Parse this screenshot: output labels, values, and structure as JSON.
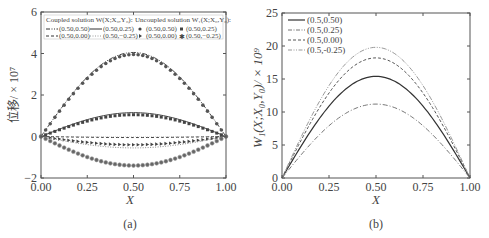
{
  "chart_data": [
    {
      "panel": "a",
      "type": "line",
      "caption": "(a)",
      "xlabel": "X",
      "ylabel": "位移/ × 10⁷",
      "xlim": [
        0,
        1
      ],
      "ylim": [
        -2,
        6
      ],
      "xticks": [
        "0.00",
        "0.25",
        "0.50",
        "0.75",
        "1.00"
      ],
      "yticks": [
        "−2",
        "0",
        "2",
        "4",
        "6"
      ],
      "grid": false,
      "legend": {
        "position": "upper",
        "coupled_title": "Coupled solution W(X;X₀,Y₀):",
        "uncoupled_title": "Uncoupled solution W₁(X;X₀,Y₀):",
        "coupled": [
          {
            "label": "(0.50,0.50)",
            "style": "dash-dot-dot"
          },
          {
            "label": "(0.50,0.25)",
            "style": "solid"
          },
          {
            "label": "(0.50,0.00)",
            "style": "dashed"
          },
          {
            "label": "(0.50,−0.25)",
            "style": "dotted"
          }
        ],
        "uncoupled": [
          {
            "label": "(0.50,0.50)",
            "marker": "circle"
          },
          {
            "label": "(0.50,0.25)",
            "marker": "square"
          },
          {
            "label": "(0.50,0.00)",
            "marker": "triangle-right"
          },
          {
            "label": "(0.50,−0.25)",
            "marker": "star"
          }
        ]
      },
      "series": [
        {
          "name": "(0.50,0.50) coupled",
          "style": "dash-dot-dot",
          "peak_x": 0.5,
          "peak_y": 4.05
        },
        {
          "name": "(0.50,0.50) uncoupled",
          "marker": "circle",
          "peak_x": 0.5,
          "peak_y": 3.95
        },
        {
          "name": "(0.50,0.25) coupled",
          "style": "solid",
          "peak_x": 0.5,
          "peak_y": 1.15
        },
        {
          "name": "(0.50,0.25) uncoupled",
          "marker": "square",
          "peak_x": 0.5,
          "peak_y": 1.05
        },
        {
          "name": "(0.50,0.00) coupled",
          "style": "dashed",
          "peak_x": 0.5,
          "peak_y": -0.05
        },
        {
          "name": "(0.50,0.00) uncoupled",
          "marker": "triangle-right",
          "peak_x": 0.5,
          "peak_y": -0.4
        },
        {
          "name": "(0.50,−0.25) coupled",
          "style": "dotted",
          "peak_x": 0.5,
          "peak_y": -0.55
        },
        {
          "name": "(0.50,−0.25) uncoupled",
          "marker": "star",
          "peak_x": 0.5,
          "peak_y": -1.4
        }
      ]
    },
    {
      "panel": "b",
      "type": "line",
      "caption": "(b)",
      "xlabel": "X",
      "ylabel": "W₁(X;X₀,Y₀)/ × 10⁹",
      "xlim": [
        0,
        1
      ],
      "ylim": [
        0,
        25
      ],
      "xticks": [
        "0.00",
        "0.25",
        "0.50",
        "0.75",
        "1.00"
      ],
      "yticks": [
        "0",
        "5",
        "10",
        "15",
        "20",
        "25"
      ],
      "grid": false,
      "legend": {
        "position": "upper left",
        "entries": [
          {
            "label": "(0.5,0.50)",
            "style": "solid"
          },
          {
            "label": "(0.5,0.25)",
            "style": "dash-dot"
          },
          {
            "label": "(0.5,0.00)",
            "style": "dashed"
          },
          {
            "label": "(0.5,-0.25)",
            "style": "dash-dot-dot"
          }
        ]
      },
      "series": [
        {
          "name": "(0.5,0.50)",
          "style": "solid",
          "peak_x": 0.5,
          "peak_y": 15.4
        },
        {
          "name": "(0.5,0.25)",
          "style": "dash-dot",
          "peak_x": 0.5,
          "peak_y": 11.2
        },
        {
          "name": "(0.5,0.00)",
          "style": "dashed",
          "peak_x": 0.5,
          "peak_y": 18.2
        },
        {
          "name": "(0.5,-0.25)",
          "style": "dash-dot-dot",
          "peak_x": 0.5,
          "peak_y": 19.8
        }
      ]
    }
  ]
}
